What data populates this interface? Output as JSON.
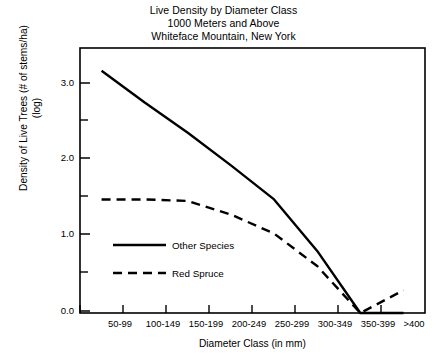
{
  "chart_data": {
    "type": "line",
    "title": "Live Density by Diameter Class 1000 Meters and Above Whiteface Mountain, New York",
    "title_lines": [
      "Live Density by Diameter Class",
      "1000 Meters and Above",
      "Whiteface Mountain, New York"
    ],
    "xlabel": "Diameter Class (in mm)",
    "ylabel": "Density of Live Trees (# of stems/ha)",
    "ylabel_line2": "(log)",
    "ylabel_lines": [
      "Density of Live Trees (# of stems/ha)",
      "(log)"
    ],
    "categories": [
      "50-99",
      "100-149",
      "150-199",
      "200-249",
      "250-299",
      "300-349",
      "350-399",
      ">400"
    ],
    "ylim": [
      0.0,
      3.5
    ],
    "yticks": [
      0.0,
      0.5,
      1.0,
      1.5,
      2.0,
      2.5,
      3.0
    ],
    "ytick_labels": [
      "0.0",
      "",
      "1.0",
      "",
      "2.0",
      "",
      "3.0"
    ],
    "ytick_labels_shown": [
      "0.0",
      "1.0",
      "2.0",
      "3.0"
    ],
    "grid": false,
    "legend_position": "inside-left",
    "series": [
      {
        "name": "Other Species",
        "style": "solid",
        "values": [
          3.2,
          2.78,
          2.38,
          1.95,
          1.5,
          0.82,
          0.0,
          0.0
        ]
      },
      {
        "name": "Red Spruce",
        "style": "dashed",
        "values": [
          1.5,
          1.5,
          1.48,
          1.3,
          1.05,
          0.62,
          0.0,
          0.3
        ]
      }
    ]
  },
  "legend": {
    "items": [
      {
        "label": "Other Species",
        "style": "solid"
      },
      {
        "label": "Red Spruce",
        "style": "dashed"
      }
    ]
  },
  "colors": {
    "line": "#000000",
    "frame": "#000000",
    "background": "#ffffff"
  }
}
